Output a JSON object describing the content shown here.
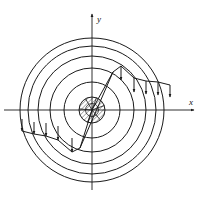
{
  "figure": {
    "title": "",
    "kind": "phase-portrait-vector-field",
    "background_color": "#ffffff",
    "stroke_color": "#1a1a1a",
    "axes": {
      "x_label": "x",
      "y_label": "y",
      "origin": {
        "x": 92,
        "y": 110
      },
      "x_axis": {
        "x1": 4,
        "y1": 110,
        "x2": 196,
        "y2": 110
      },
      "y_axis": {
        "x1": 92,
        "y1": 190,
        "x2": 92,
        "y2": 12
      },
      "x_arrow_at": {
        "x": 196,
        "y": 110
      },
      "y_arrow_at": {
        "x": 92,
        "y": 12
      },
      "x_label_pos": {
        "x": 190,
        "y": 104
      },
      "y_label_pos": {
        "x": 98,
        "y": 20
      }
    },
    "level_curves": {
      "description": "concentric circles centered at origin",
      "count": 5,
      "radii": [
        28,
        42,
        54,
        64,
        72
      ],
      "center_disc": {
        "radius": 13,
        "hatched": true,
        "hatch_spacing": 3.2,
        "hatch_angle_deg": 45
      }
    },
    "center_spokes": {
      "count": 6,
      "radius": 13,
      "angles_deg": [
        20,
        70,
        120,
        175,
        250,
        310
      ]
    },
    "trajectory": {
      "description": "polyline spiral path crossing level curves",
      "points": [
        {
          "x": 92,
          "y": 110
        },
        {
          "x": 113,
          "y": 72
        },
        {
          "x": 121,
          "y": 66
        },
        {
          "x": 134,
          "y": 78
        },
        {
          "x": 146,
          "y": 81
        },
        {
          "x": 158,
          "y": 82
        },
        {
          "x": 170,
          "y": 85
        },
        {
          "x": 92,
          "y": 110
        },
        {
          "x": 80,
          "y": 148
        },
        {
          "x": 72,
          "y": 152
        },
        {
          "x": 58,
          "y": 140
        },
        {
          "x": 46,
          "y": 136
        },
        {
          "x": 34,
          "y": 134
        },
        {
          "x": 22,
          "y": 131
        }
      ]
    },
    "field_arrows": {
      "description": "short vertical vector arrows along the trajectory",
      "right_branch": [
        {
          "x": 121,
          "y1": 66,
          "y2": 80
        },
        {
          "x": 134,
          "y1": 78,
          "y2": 92
        },
        {
          "x": 146,
          "y1": 81,
          "y2": 94
        },
        {
          "x": 158,
          "y1": 82,
          "y2": 95
        },
        {
          "x": 170,
          "y1": 85,
          "y2": 97
        }
      ],
      "left_branch": [
        {
          "x": 72,
          "y1": 152,
          "y2": 138
        },
        {
          "x": 58,
          "y1": 140,
          "y2": 126
        },
        {
          "x": 46,
          "y1": 136,
          "y2": 123
        },
        {
          "x": 34,
          "y1": 134,
          "y2": 122
        },
        {
          "x": 22,
          "y1": 131,
          "y2": 119
        }
      ]
    }
  }
}
